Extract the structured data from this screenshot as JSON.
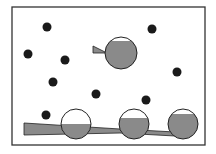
{
  "diagram": {
    "colors": {
      "frame": "#333333",
      "dot": "#1a1a1a",
      "fill": "#8a8a8a",
      "outline": "#222222",
      "background": "#ffffff"
    },
    "frame": {
      "x": 12,
      "y": 7,
      "w": 193,
      "h": 138
    },
    "dots": [
      {
        "cx": 47,
        "cy": 27
      },
      {
        "cx": 152,
        "cy": 29
      },
      {
        "cx": 28,
        "cy": 54
      },
      {
        "cx": 65,
        "cy": 60
      },
      {
        "cx": 53,
        "cy": 82
      },
      {
        "cx": 177,
        "cy": 72
      },
      {
        "cx": 96,
        "cy": 94
      },
      {
        "cx": 146,
        "cy": 100
      },
      {
        "cx": 46,
        "cy": 115
      }
    ],
    "droplets": [
      {
        "cx": 121,
        "cy": 53,
        "r": 16,
        "fill_level": 0.9
      },
      {
        "cx": 76,
        "cy": 124,
        "r": 15,
        "fill_level": 0.5
      },
      {
        "cx": 134,
        "cy": 124,
        "r": 15,
        "fill_level": 0.75
      },
      {
        "cx": 183,
        "cy": 124,
        "r": 15,
        "fill_level": 0.85
      }
    ]
  }
}
